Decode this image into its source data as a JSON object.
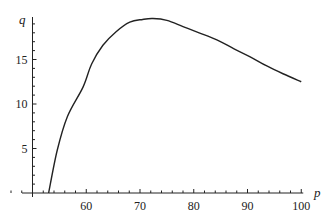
{
  "chart_data": {
    "type": "line",
    "title": "",
    "xlabel": "p",
    "ylabel": "q",
    "xlim": [
      50,
      100
    ],
    "ylim": [
      0,
      20
    ],
    "grid": false,
    "legend": null,
    "x_ticks_major": [
      60,
      70,
      80,
      90,
      100
    ],
    "x_tick_labels": [
      "60",
      "70",
      "80",
      "90",
      "100"
    ],
    "x_ticks_minor_step": 2,
    "y_ticks_major": [
      5,
      10,
      15
    ],
    "y_tick_labels": [
      "5",
      "10",
      "15"
    ],
    "y_ticks_minor_step": 1,
    "series": [
      {
        "name": "q(p)",
        "x": [
          53.0,
          54.6,
          56.5,
          59.4,
          61.0,
          63.1,
          65.5,
          68.1,
          70.5,
          72.4,
          75.0,
          78.0,
          81.0,
          84.3,
          87.5,
          90.5,
          93.5,
          96.6,
          100.0
        ],
        "values": [
          0.0,
          4.8,
          8.6,
          11.9,
          14.5,
          16.6,
          18.1,
          19.2,
          19.5,
          19.6,
          19.4,
          18.7,
          18.0,
          17.2,
          16.2,
          15.3,
          14.3,
          13.4,
          12.5
        ]
      }
    ]
  }
}
